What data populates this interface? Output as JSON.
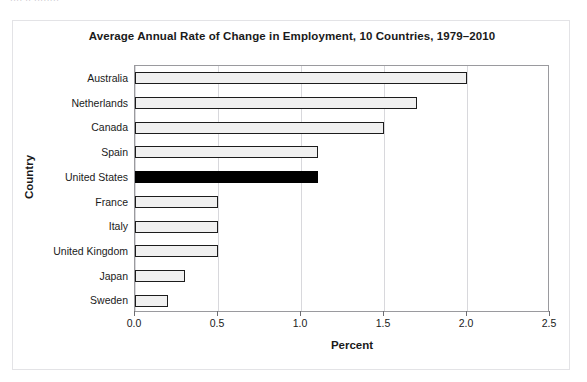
{
  "page": {
    "top_sliver_text": "···· ·· ········"
  },
  "chart_data": {
    "type": "bar",
    "orientation": "horizontal",
    "title": "Average Annual Rate of Change in Employment, 10 Countries, 1979–2010",
    "xlabel": "Percent",
    "ylabel": "Country",
    "categories": [
      "Australia",
      "Netherlands",
      "Canada",
      "Spain",
      "United States",
      "France",
      "Italy",
      "United Kingdom",
      "Japan",
      "Sweden"
    ],
    "values": [
      2.0,
      1.7,
      1.5,
      1.1,
      1.1,
      0.5,
      0.5,
      0.5,
      0.3,
      0.2
    ],
    "highlight_category": "United States",
    "highlight_color": "#000000",
    "bar_fill_color": "#f0f0f0",
    "bar_border_color": "#1c1c1c",
    "xlim": [
      0.0,
      2.5
    ],
    "xticks": [
      0.0,
      0.5,
      1.0,
      1.5,
      2.0,
      2.5
    ],
    "xtick_labels": [
      "0.0",
      "0.5",
      "1.0",
      "1.5",
      "2.0",
      "2.5"
    ],
    "grid": "vertical",
    "legend": "none"
  }
}
